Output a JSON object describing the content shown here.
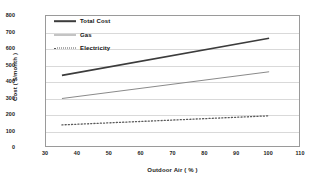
{
  "chart_data": {
    "type": "line",
    "title": "",
    "xlabel": "Outdoor Air ( % )",
    "ylabel": "Cost ( $/month )",
    "xlim": [
      30,
      110
    ],
    "ylim": [
      0,
      800
    ],
    "xticks": [
      30,
      40,
      50,
      60,
      70,
      80,
      90,
      100,
      110
    ],
    "yticks": [
      0,
      100,
      200,
      300,
      400,
      500,
      600,
      700,
      800
    ],
    "grid": "horizontal",
    "legend_position": "top-left",
    "x": [
      35,
      100
    ],
    "series": [
      {
        "name": "Total Cost",
        "style": "solid-thick",
        "color": "#3c3c3c",
        "values": [
          440,
          665
        ]
      },
      {
        "name": "Gas",
        "style": "solid-thin",
        "color": "#8a8a8a",
        "values": [
          300,
          462
        ]
      },
      {
        "name": "Electricity",
        "style": "dotted",
        "color": "#5a5a5a",
        "values": [
          140,
          195
        ]
      }
    ]
  },
  "axes": {
    "x_title": "Outdoor Air ( % )",
    "y_title": "Cost ( $/month )",
    "x_tick_labels": [
      "30",
      "40",
      "50",
      "60",
      "70",
      "80",
      "90",
      "100",
      "110"
    ],
    "y_tick_labels": [
      "0",
      "100",
      "200",
      "300",
      "400",
      "500",
      "600",
      "700",
      "800"
    ]
  },
  "legend": {
    "items": [
      {
        "label": "Total Cost"
      },
      {
        "label": "Gas"
      },
      {
        "label": "Electricity"
      }
    ]
  }
}
